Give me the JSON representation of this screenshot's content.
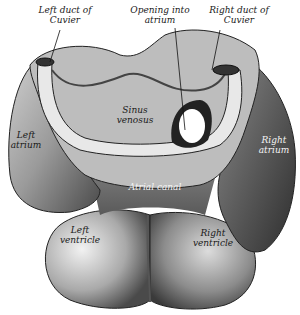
{
  "figure": {
    "labels": {
      "left_duct": [
        "Left duct of",
        "Cuvier"
      ],
      "opening": [
        "Opening into",
        "atrium"
      ],
      "right_duct": [
        "Right duct of",
        "Cuvier"
      ],
      "sinus": [
        "Sinus",
        "venosus"
      ],
      "left_atrium": [
        "Left",
        "atrium"
      ],
      "right_atrium": [
        "Right",
        "atrium"
      ],
      "atrial_canal": [
        "Atrial canal"
      ],
      "left_ventricle": [
        "Left",
        "ventricle"
      ],
      "right_ventricle": [
        "Right",
        "ventricle"
      ]
    },
    "colors": {
      "ink": "#1a1a1a",
      "mid": "#8a8a8a",
      "light": "#d8d8d8",
      "dark": "#3a3a3a"
    }
  }
}
